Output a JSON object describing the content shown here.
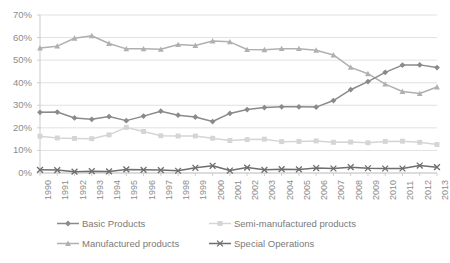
{
  "chart_data": {
    "type": "line",
    "title": "",
    "subtitle": "",
    "xlabel": "",
    "ylabel": "",
    "grid": true,
    "legend_position": "bottom",
    "ylim": [
      0,
      70
    ],
    "ytick_labels": [
      "70%",
      "60%",
      "50%",
      "40%",
      "30%",
      "20%",
      "10%",
      "0%"
    ],
    "ytick_values": [
      70,
      60,
      50,
      40,
      30,
      20,
      10,
      0
    ],
    "categories": [
      "1990",
      "1991",
      "1992",
      "1993",
      "1994",
      "1995",
      "1996",
      "1997",
      "1998",
      "1999",
      "2000",
      "2001",
      "2002",
      "2003",
      "2004",
      "2005",
      "2006",
      "2007",
      "2008",
      "2009",
      "2010",
      "2011",
      "2012",
      "2013"
    ],
    "series": [
      {
        "name": "Basic Products",
        "color": "#8a8a8a",
        "marker": "diamond",
        "values": [
          26.9,
          27.0,
          24.4,
          23.8,
          25.0,
          23.2,
          25.2,
          27.4,
          25.6,
          24.8,
          22.8,
          26.4,
          28.1,
          29.0,
          29.3,
          29.3,
          29.2,
          32.1,
          36.9,
          40.5,
          44.6,
          47.8,
          47.9,
          46.7
        ]
      },
      {
        "name": "Semi-manufactured products",
        "color": "#d5d5d5",
        "marker": "square",
        "values": [
          16.3,
          15.5,
          15.3,
          15.2,
          16.9,
          20.2,
          18.4,
          16.5,
          16.4,
          16.4,
          15.4,
          14.4,
          14.8,
          15.0,
          13.9,
          14.0,
          14.2,
          13.6,
          13.7,
          13.4,
          14.0,
          14.1,
          13.6,
          12.6
        ]
      },
      {
        "name": "Manufactured products",
        "color": "#b0b0b0",
        "marker": "triangle",
        "values": [
          55.4,
          56.2,
          59.7,
          60.8,
          57.4,
          55.0,
          55.0,
          54.8,
          56.9,
          56.5,
          58.5,
          58.1,
          54.7,
          54.6,
          55.1,
          55.1,
          54.4,
          52.3,
          46.8,
          44.0,
          39.4,
          36.1,
          35.2,
          38.1
        ]
      },
      {
        "name": "Special Operations",
        "color": "#6e6e6e",
        "marker": "cross",
        "values": [
          1.4,
          1.3,
          0.6,
          0.8,
          0.7,
          1.6,
          1.4,
          1.3,
          1.0,
          2.3,
          3.2,
          1.1,
          2.4,
          1.4,
          1.7,
          1.6,
          2.2,
          2.0,
          2.6,
          2.1,
          2.0,
          2.0,
          3.3,
          2.6
        ]
      }
    ]
  },
  "legend": {
    "entries": [
      {
        "label": "Basic Products"
      },
      {
        "label": "Semi-manufactured products"
      },
      {
        "label": "Manufactured products"
      },
      {
        "label": "Special Operations"
      }
    ]
  }
}
